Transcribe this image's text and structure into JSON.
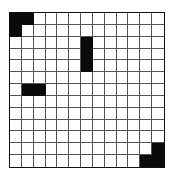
{
  "grid": {
    "rows": 13,
    "cols": 13,
    "filled_color": "#0a0a0a",
    "empty_color": "#ffffff",
    "line_color": "#555555",
    "filled_cells": [
      [
        0,
        0
      ],
      [
        0,
        1
      ],
      [
        1,
        0
      ],
      [
        2,
        6
      ],
      [
        3,
        6
      ],
      [
        4,
        6
      ],
      [
        6,
        1
      ],
      [
        6,
        2
      ],
      [
        11,
        12
      ],
      [
        12,
        11
      ],
      [
        12,
        12
      ]
    ]
  }
}
